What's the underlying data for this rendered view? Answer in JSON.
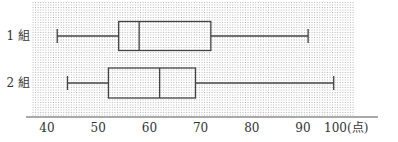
{
  "chart_data": {
    "type": "boxplot",
    "title": "",
    "xlabel": "点",
    "ylabel": "",
    "xlim": [
      40,
      100
    ],
    "x_ticks": [
      40,
      50,
      60,
      70,
      80,
      90,
      100
    ],
    "x_tick_labels": [
      "40",
      "50",
      "60",
      "70",
      "80",
      "90",
      "100(点)"
    ],
    "grid": "vertical dotted, 1-point spacing",
    "orientation": "horizontal",
    "series": [
      {
        "name": "1 組",
        "min": 42,
        "q1": 54,
        "median": 58,
        "q3": 72,
        "max": 91
      },
      {
        "name": "2 組",
        "min": 44,
        "q1": 52,
        "median": 62,
        "q3": 69,
        "max": 96
      }
    ]
  },
  "layout": {
    "x_at_40": 47,
    "px_per_point": 5.12,
    "grid_left": 33,
    "grid_right": 354,
    "grid_top": 2,
    "axis_y": 117,
    "axis_left": 26,
    "axis_right": 378,
    "rows": [
      {
        "center": 36,
        "half_h": 14.5
      },
      {
        "center": 83,
        "half_h": 15
      }
    ]
  },
  "colors": {
    "stroke": "#444444",
    "grid": "#9a9a9a",
    "background": "#ffffff"
  }
}
